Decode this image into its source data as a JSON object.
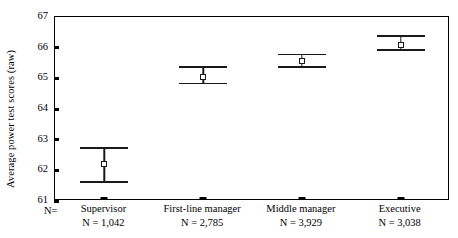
{
  "chart_data": {
    "type": "scatter",
    "title": "",
    "xlabel": "",
    "ylabel": "Average power test scores (raw)",
    "ylim": [
      61,
      67
    ],
    "ytick_labels": [
      "67",
      "66",
      "65",
      "64",
      "63",
      "62",
      "61"
    ],
    "yticks": [
      67,
      66,
      65,
      64,
      63,
      62,
      61
    ],
    "grid": false,
    "legend": "none",
    "n_prefix_label": "N=",
    "categories": [
      "Supervisor",
      "First-line manager",
      "Middle manager",
      "Executive"
    ],
    "n_labels": [
      "N = 1,042",
      "N = 2,785",
      "N = 3,929",
      "N = 3,038"
    ],
    "n_values": [
      1042,
      2785,
      3929,
      3038
    ],
    "values": [
      62.2,
      65.05,
      65.55,
      66.1
    ],
    "ci_lower": [
      61.6,
      64.8,
      65.35,
      65.9
    ],
    "ci_upper": [
      62.75,
      65.4,
      65.8,
      66.4
    ],
    "series": [
      {
        "name": "Average power test scores (raw)",
        "points": [
          {
            "category": "Supervisor",
            "mean": 62.2,
            "lower": 61.6,
            "upper": 62.75,
            "n": "N = 1,042"
          },
          {
            "category": "First-line manager",
            "mean": 65.05,
            "lower": 64.8,
            "upper": 65.4,
            "n": "N = 2,785"
          },
          {
            "category": "Middle manager",
            "mean": 65.55,
            "lower": 65.35,
            "upper": 65.8,
            "n": "N = 3,929"
          },
          {
            "category": "Executive",
            "mean": 66.1,
            "lower": 65.9,
            "upper": 66.4,
            "n": "N = 3,038"
          }
        ]
      }
    ],
    "marker": "open-square",
    "colors": {
      "line": "#1a1a1a",
      "marker_fill": "#ffffff",
      "axis": "#000000",
      "background": "#ffffff"
    }
  }
}
